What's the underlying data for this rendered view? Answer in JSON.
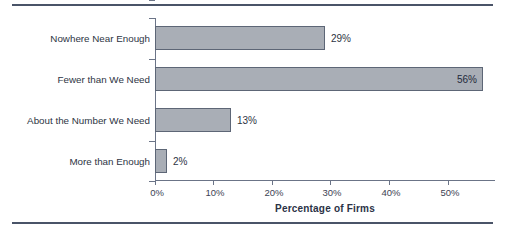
{
  "chart_data": {
    "type": "bar",
    "orientation": "horizontal",
    "title": "",
    "xlabel": "Percentage of Firms",
    "ylabel": "",
    "categories": [
      "Nowhere Near Enough",
      "Fewer than We Need",
      "About the Number We Need",
      "More than Enough"
    ],
    "values": [
      29,
      56,
      13,
      2
    ],
    "value_labels": [
      "29%",
      "56%",
      "13%",
      "2%"
    ],
    "label_placement": [
      "outside",
      "inside",
      "outside",
      "outside"
    ],
    "xlim": [
      0,
      56
    ],
    "xticks": [
      0,
      10,
      20,
      30,
      40,
      50
    ],
    "xtick_labels": [
      "0%",
      "10%",
      "20%",
      "30%",
      "40%",
      "50%"
    ],
    "grid": false,
    "legend": null,
    "colors": {
      "bar_fill": "#a9aeb6",
      "bar_edge": "#5d6676",
      "axis": "#6b7487",
      "text": "#2d3443",
      "rule": "#4a5468"
    }
  }
}
